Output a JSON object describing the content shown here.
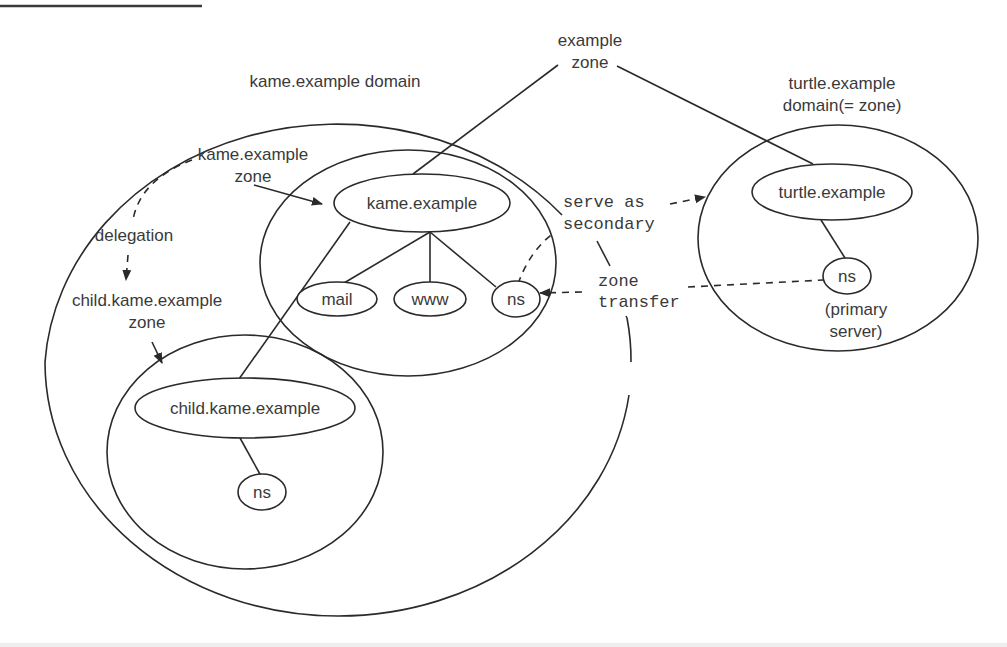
{
  "diagram": {
    "labels": {
      "example_zone_line1": "example",
      "example_zone_line2": "zone",
      "kame_domain": "kame.example domain",
      "kame_zone_line1": "kame.example",
      "kame_zone_line2": "zone",
      "delegation": "delegation",
      "child_zone_line1": "child.kame.example",
      "child_zone_line2": "zone",
      "turtle_domain_line1": "turtle.example",
      "turtle_domain_line2": "domain(= zone)",
      "serve_line1": "serve as",
      "serve_line2": "secondary",
      "transfer_line1": "zone",
      "transfer_line2": "transfer",
      "primary_line1": "(primary",
      "primary_line2": "server)"
    },
    "nodes": {
      "kame": "kame.example",
      "mail": "mail",
      "www": "www",
      "kame_ns": "ns",
      "child": "child.kame.example",
      "child_ns": "ns",
      "turtle": "turtle.example",
      "turtle_ns": "ns"
    },
    "regions": [
      {
        "id": "kame-domain",
        "label": "kame.example domain"
      },
      {
        "id": "kame-zone",
        "label": "kame.example zone"
      },
      {
        "id": "child-zone",
        "label": "child.kame.example zone"
      },
      {
        "id": "turtle-domain",
        "label": "turtle.example domain(= zone)"
      }
    ],
    "edges": [
      {
        "from": "example zone",
        "to": "kame.example",
        "style": "solid"
      },
      {
        "from": "example zone",
        "to": "turtle.example",
        "style": "solid"
      },
      {
        "from": "kame.example",
        "to": "mail",
        "style": "solid"
      },
      {
        "from": "kame.example",
        "to": "www",
        "style": "solid"
      },
      {
        "from": "kame.example",
        "to": "ns",
        "style": "solid"
      },
      {
        "from": "kame.example",
        "to": "child.kame.example",
        "style": "solid"
      },
      {
        "from": "child.kame.example",
        "to": "ns",
        "style": "solid"
      },
      {
        "from": "turtle.example",
        "to": "ns",
        "style": "solid"
      },
      {
        "from": "kame.example zone",
        "to": "child.kame.example zone",
        "style": "dashed",
        "label": "delegation"
      },
      {
        "from": "kame ns",
        "to": "turtle.example domain",
        "style": "dashed",
        "label": "serve as secondary"
      },
      {
        "from": "turtle ns",
        "to": "kame ns",
        "style": "dashed",
        "label": "zone transfer"
      }
    ],
    "colors": {
      "stroke": "#2a2a2a",
      "text": "#3a3a3a",
      "background": "#ffffff"
    }
  }
}
